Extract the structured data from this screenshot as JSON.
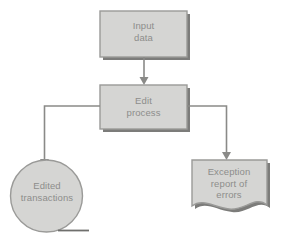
{
  "diagram": {
    "type": "flowchart",
    "background_color": "#ffffff",
    "shape_fill_color": "#d5d5d3",
    "shape_border_color": "#9a9a98",
    "shape_shadow_color": "#7c7c7a",
    "connector_color": "#8a8a88",
    "text_color": "#8d8d8b",
    "nodes": [
      {
        "id": "input-data",
        "label": "Input\ndata",
        "shape": "rectangle",
        "role": "input"
      },
      {
        "id": "edit-process",
        "label": "Edit\nprocess",
        "shape": "rectangle",
        "role": "process"
      },
      {
        "id": "edited-transactions",
        "label": "Edited\ntransactions",
        "shape": "magnetic-tape-circle",
        "role": "storage"
      },
      {
        "id": "exception-report",
        "label": "Exception\nreport of\nerrors",
        "shape": "document",
        "role": "output"
      }
    ],
    "connectors": [
      {
        "id": "input-to-edit",
        "from": "input-data",
        "to": "edit-process",
        "style": "straight-arrow-down"
      },
      {
        "id": "edit-to-edited-transactions",
        "from": "edit-process",
        "to": "edited-transactions",
        "style": "elbow-left-then-down-arrow"
      },
      {
        "id": "edit-to-exception-report",
        "from": "edit-process",
        "to": "exception-report",
        "style": "elbow-right-then-down-arrow"
      }
    ]
  }
}
